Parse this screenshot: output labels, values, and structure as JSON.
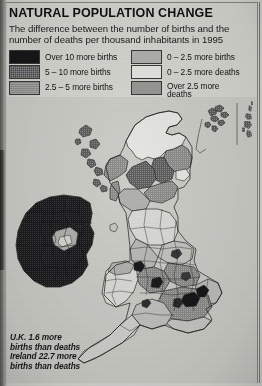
{
  "header": {
    "title": "NATURAL POPULATION CHANGE",
    "subtitle_line1": "The difference between the number of births and the",
    "subtitle_line2": "number of deaths per thousand inhabitants in 1995"
  },
  "legend": {
    "left_column": [
      {
        "label": "Over 10 more births",
        "color": "#17171a",
        "swatch": "sw-1"
      },
      {
        "label": "5 – 10 more births",
        "color": "#4c4c4e",
        "swatch": "sw-2"
      },
      {
        "label": "2.5 – 5 more births",
        "color": "#8f8f8d",
        "swatch": "sw-3"
      }
    ],
    "right_column": [
      {
        "label": "0 – 2.5 more births",
        "color": "#b3b3af",
        "swatch": "sw-4"
      },
      {
        "label": "0 – 2.5 more deaths",
        "color": "#e8e8e4",
        "swatch": "sw-5"
      },
      {
        "label": "Over 2.5 more\ndeaths",
        "color": "#9a9a96",
        "swatch": "sw-6"
      }
    ]
  },
  "caption": {
    "line1": "U.K. 1.6 more",
    "line2": "births than deaths",
    "line3": "Ireland 22.7 more",
    "line4": "births than deaths"
  },
  "map": {
    "title": "Natural population change in the United Kingdom and Ireland, 1995",
    "insets": [
      "Orkney Islands",
      "Shetland Islands"
    ],
    "regions": [
      {
        "name": "Ireland",
        "class": "over-10-more-births"
      },
      {
        "name": "Northern Ireland",
        "class": "over-10-more-births"
      },
      {
        "name": "Scottish Highlands",
        "class": "0-2.5-more-deaths"
      },
      {
        "name": "Central Scotland",
        "class": "2.5-5-more-births"
      },
      {
        "name": "Northern England",
        "class": "0-2.5-more-births"
      },
      {
        "name": "Midlands",
        "class": "2.5-5-more-births"
      },
      {
        "name": "Wales",
        "class": "0-2.5-more-deaths"
      },
      {
        "name": "South East England",
        "class": "2.5-5-more-births"
      },
      {
        "name": "Greater London",
        "class": "over-10-more-births"
      },
      {
        "name": "South West England",
        "class": "0-2.5-more-deaths"
      }
    ]
  },
  "colors": {
    "paper": "#d9d9d4",
    "sea": "#cfcfca",
    "outline": "#2e2e2b",
    "ink": "#111111"
  }
}
